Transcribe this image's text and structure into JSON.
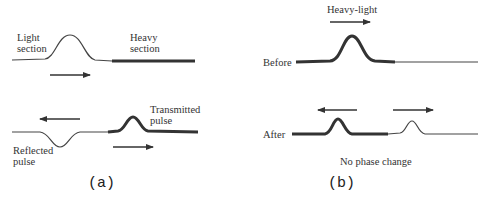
{
  "panel_a": {
    "caption": "(a)",
    "light_label_1": "Light",
    "light_label_2": "section",
    "heavy_label_1": "Heavy",
    "heavy_label_2": "section",
    "reflected_label_1": "Reflected",
    "reflected_label_2": "pulse",
    "transmitted_label_1": "Transmitted",
    "transmitted_label_2": "pulse"
  },
  "panel_b": {
    "caption": "(b)",
    "title": "Heavy-light",
    "before_label": "Before",
    "after_label": "After",
    "note": "No phase change"
  },
  "colors": {
    "line": "#333333",
    "text": "#333333"
  }
}
